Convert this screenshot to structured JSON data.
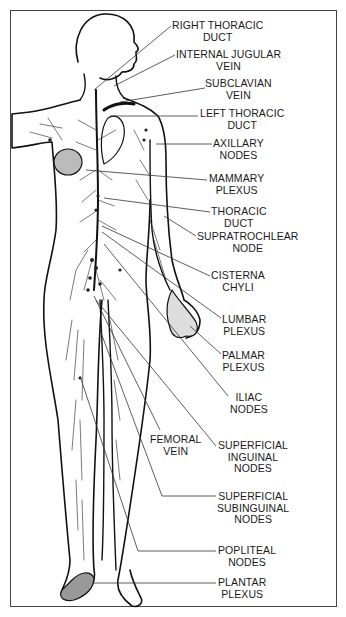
{
  "figure": {
    "labels": [
      {
        "id": "right-thoracic-duct",
        "lines": [
          "RIGHT THORACIC",
          "DUCT"
        ],
        "x": 172,
        "y": 20
      },
      {
        "id": "internal-jugular-vein",
        "lines": [
          "INTERNAL JUGULAR",
          "VEIN"
        ],
        "x": 176,
        "y": 49
      },
      {
        "id": "subclavian-vein",
        "lines": [
          "SUBCLAVIAN",
          "VEIN"
        ],
        "x": 205,
        "y": 78
      },
      {
        "id": "left-thoracic-duct",
        "lines": [
          "LEFT THORACIC",
          "DUCT"
        ],
        "x": 200,
        "y": 108
      },
      {
        "id": "axillary-nodes",
        "lines": [
          "AXILLARY",
          "NODES"
        ],
        "x": 213,
        "y": 138
      },
      {
        "id": "mammary-plexus",
        "lines": [
          "MAMMARY",
          "PLEXUS"
        ],
        "x": 209,
        "y": 173
      },
      {
        "id": "thoracic-duct",
        "lines": [
          "THORACIC",
          "DUCT"
        ],
        "x": 211,
        "y": 206
      },
      {
        "id": "supratrochlear-node",
        "lines": [
          "SUPRATROCHLEAR",
          "NODE"
        ],
        "x": 197,
        "y": 231
      },
      {
        "id": "cisterna-chyli",
        "lines": [
          "CISTERNA",
          "CHYLI"
        ],
        "x": 211,
        "y": 270
      },
      {
        "id": "lumbar-plexus",
        "lines": [
          "LUMBAR",
          "PLEXUS"
        ],
        "x": 222,
        "y": 314
      },
      {
        "id": "palmar-plexus",
        "lines": [
          "PALMAR",
          "PLEXUS"
        ],
        "x": 222,
        "y": 350
      },
      {
        "id": "iliac-nodes",
        "lines": [
          "ILIAC",
          "NODES"
        ],
        "x": 230,
        "y": 392
      },
      {
        "id": "femoral-vein",
        "lines": [
          "FEMORAL",
          "VEIN"
        ],
        "x": 150,
        "y": 434
      },
      {
        "id": "superficial-inguinal-nodes",
        "lines": [
          "SUPERFICIAL",
          "INGUINAL",
          "NODES"
        ],
        "x": 218,
        "y": 440
      },
      {
        "id": "superficial-subinguinal-nodes",
        "lines": [
          "SUPERFICIAL",
          "SUBINGUINAL",
          "NODES"
        ],
        "x": 217,
        "y": 491
      },
      {
        "id": "popliteal-nodes",
        "lines": [
          "POPLITEAL",
          "NODES"
        ],
        "x": 218,
        "y": 545
      },
      {
        "id": "plantar-plexus",
        "lines": [
          "PLANTAR",
          "PLEXUS"
        ],
        "x": 218,
        "y": 577
      }
    ]
  }
}
